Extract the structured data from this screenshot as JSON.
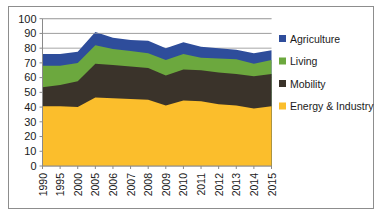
{
  "figure": {
    "border_color": "#8d8d8d",
    "background": "#ffffff"
  },
  "legend": {
    "position": "right",
    "items": [
      {
        "label": "Agriculture",
        "color": "#2E4D9B",
        "swatch_name": "legend-swatch-agriculture"
      },
      {
        "label": "Living",
        "color": "#6CA83E",
        "swatch_name": "legend-swatch-living"
      },
      {
        "label": "Mobility",
        "color": "#3A332A",
        "swatch_name": "legend-swatch-mobility"
      },
      {
        "label": "Energy & Industry",
        "color": "#FBBE2C",
        "swatch_name": "legend-swatch-energy-industry"
      }
    ]
  },
  "axes": {
    "y_ticks": [
      0,
      10,
      20,
      30,
      40,
      50,
      60,
      70,
      80,
      90,
      100
    ],
    "y_tick_labels": [
      "0",
      "10",
      "20",
      "30",
      "40",
      "50",
      "60",
      "70",
      "80",
      "90",
      "100"
    ],
    "ylim": [
      0,
      100
    ],
    "x_tick_labels": [
      "1990",
      "1995",
      "2000",
      "2005",
      "2006",
      "2007",
      "2008",
      "2009",
      "2010",
      "2011",
      "2012",
      "2013",
      "2014",
      "2015"
    ],
    "grid": "horizontal"
  },
  "chart_data": {
    "type": "area",
    "stacked": true,
    "title": "",
    "xlabel": "",
    "ylabel": "",
    "ylim": [
      0,
      100
    ],
    "categories": [
      "1990",
      "1995",
      "2000",
      "2005",
      "2006",
      "2007",
      "2008",
      "2009",
      "2010",
      "2011",
      "2012",
      "2013",
      "2014",
      "2015"
    ],
    "series": [
      {
        "name": "Energy & Industry",
        "color": "#FBBE2C",
        "values": [
          40.5,
          40.5,
          40.0,
          46.5,
          46.0,
          45.5,
          45.0,
          41.0,
          44.5,
          44.0,
          42.0,
          41.0,
          39.0,
          40.5
        ]
      },
      {
        "name": "Mobility",
        "color": "#3A332A",
        "values": [
          13.0,
          14.5,
          17.5,
          23.0,
          22.5,
          22.0,
          21.5,
          20.5,
          21.0,
          21.0,
          21.5,
          21.5,
          22.0,
          22.0
        ]
      },
      {
        "name": "Living",
        "color": "#6CA83E",
        "values": [
          14.5,
          13.0,
          12.5,
          12.5,
          11.0,
          10.5,
          10.0,
          10.5,
          10.5,
          8.5,
          9.5,
          10.0,
          8.5,
          9.5
        ]
      },
      {
        "name": "Agriculture",
        "color": "#2E4D9B",
        "values": [
          8.0,
          8.0,
          7.5,
          9.0,
          7.5,
          7.5,
          8.5,
          8.0,
          8.0,
          7.5,
          7.0,
          6.5,
          7.0,
          6.5
        ]
      }
    ],
    "stack_tops": {
      "Energy & Industry": [
        40.5,
        40.5,
        40.0,
        46.5,
        46.0,
        45.5,
        45.0,
        41.0,
        44.5,
        44.0,
        42.0,
        41.0,
        39.0,
        40.5
      ],
      "Mobility": [
        53.5,
        55.0,
        57.5,
        69.5,
        68.5,
        67.5,
        66.5,
        61.5,
        65.5,
        65.0,
        63.5,
        62.5,
        61.0,
        62.5
      ],
      "Living": [
        68.0,
        68.0,
        70.0,
        82.0,
        79.5,
        78.0,
        76.5,
        72.0,
        76.0,
        73.5,
        73.0,
        72.5,
        69.5,
        72.0
      ],
      "Agriculture": [
        76.0,
        76.0,
        77.5,
        91.0,
        87.0,
        85.5,
        85.0,
        80.0,
        84.0,
        81.0,
        80.0,
        79.0,
        76.5,
        78.5
      ]
    }
  }
}
